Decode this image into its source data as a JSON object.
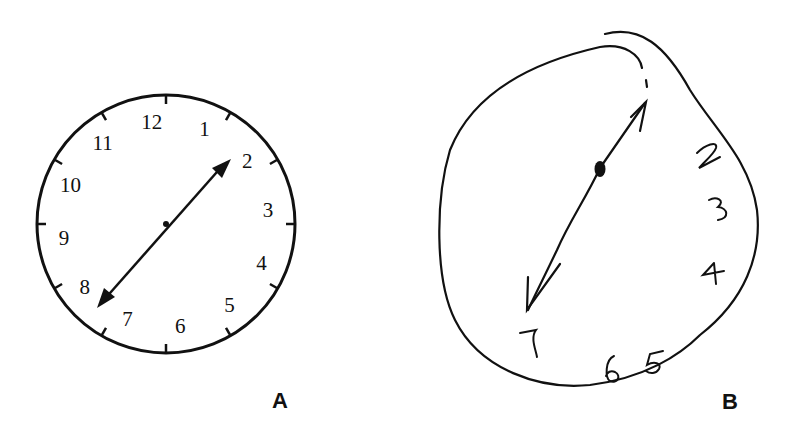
{
  "figure": {
    "panels": [
      {
        "id": "A",
        "label": "A",
        "description": "Normal clock drawing",
        "numerals": [
          "12",
          "1",
          "2",
          "3",
          "4",
          "5",
          "6",
          "7",
          "8",
          "9",
          "10",
          "11"
        ],
        "hands": {
          "from": "7",
          "to": "2"
        }
      },
      {
        "id": "B",
        "label": "B",
        "description": "Abnormal clock drawing with numerals crowded on the right side",
        "numerals": [
          "1",
          "2",
          "3",
          "4",
          "5",
          "6",
          "7"
        ],
        "hands": {
          "from": "7",
          "to": "1"
        }
      }
    ]
  },
  "colors": {
    "ink": "#111111",
    "background": "#ffffff"
  }
}
